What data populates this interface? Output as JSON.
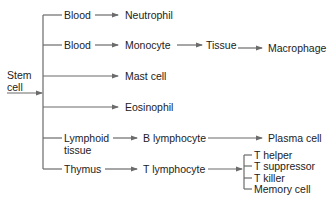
{
  "diagram": {
    "root": {
      "line1": "Stem",
      "line2": "cell"
    },
    "rows": [
      {
        "nodes": [
          "Blood",
          "Neutrophil"
        ]
      },
      {
        "nodes": [
          "Blood",
          "Monocyte",
          "Tissue",
          "Macrophage"
        ]
      },
      {
        "nodes": [
          "Mast cell"
        ]
      },
      {
        "nodes": [
          "Eosinophil"
        ]
      },
      {
        "nodes": [
          "Lymphoid",
          "tissue",
          "B lymphocyte",
          "Plasma cell"
        ]
      },
      {
        "nodes": [
          "Thymus",
          "T lymphocyte"
        ]
      }
    ],
    "t_subtypes": [
      "T helper",
      "T suppressor",
      "T killer",
      "Memory cell"
    ],
    "line_color": "#6b6b6b"
  }
}
